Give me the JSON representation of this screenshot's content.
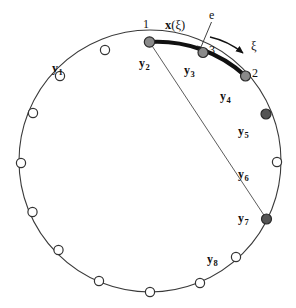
{
  "figure": {
    "name": "circle-element-diagram",
    "geometry": {
      "center_x": 150,
      "center_y": 161,
      "radius": 131,
      "width": 296,
      "height": 308
    },
    "colors": {
      "curve": "#3a3a3a",
      "element_arc": "#111111",
      "node_open_fill": "#ffffff",
      "node_open_stroke": "#333333",
      "node_gray_fill": "#8a8a8a",
      "node_dark_fill": "#555555",
      "node_stroke": "#2b2b2b",
      "chord": "#4a4a4a",
      "text": "#111111"
    }
  },
  "control_point_labels": [
    {
      "id": "y1",
      "base": "y",
      "sub": "1",
      "x": 52,
      "y": 62
    },
    {
      "id": "y2",
      "base": "y",
      "sub": "2",
      "x": 139,
      "y": 57
    },
    {
      "id": "y3",
      "base": "y",
      "sub": "3",
      "x": 184,
      "y": 64
    },
    {
      "id": "y4",
      "base": "y",
      "sub": "4",
      "x": 220,
      "y": 90
    },
    {
      "id": "y5",
      "base": "y",
      "sub": "5",
      "x": 238,
      "y": 125
    },
    {
      "id": "y6",
      "base": "y",
      "sub": "6",
      "x": 238,
      "y": 168
    },
    {
      "id": "y7",
      "base": "y",
      "sub": "7",
      "x": 238,
      "y": 212
    },
    {
      "id": "y8",
      "base": "y",
      "sub": "8",
      "x": 207,
      "y": 253
    }
  ],
  "element_nodes": [
    {
      "id": "node-1",
      "number": "1",
      "cx": 149.5,
      "cy": 42.0,
      "fill": "gray",
      "r": 5.2,
      "label_x": 143,
      "label_y": 18
    },
    {
      "id": "node-3",
      "number": "3",
      "cx": 203.0,
      "cy": 52.5,
      "fill": "gray",
      "r": 5.0,
      "label_x": 209,
      "label_y": 44
    },
    {
      "id": "node-2",
      "number": "2",
      "cx": 245.5,
      "cy": 76.0,
      "fill": "gray",
      "r": 5.0,
      "label_x": 252,
      "label_y": 67
    }
  ],
  "circle_nodes": [
    {
      "id": "cn-1",
      "cx": 266.0,
      "cy": 114.0,
      "fill": "dark",
      "r": 5.0
    },
    {
      "id": "cn-2",
      "cx": 277.0,
      "cy": 162.0,
      "fill": "open",
      "r": 4.6
    },
    {
      "id": "cn-3",
      "cx": 266.5,
      "cy": 219.0,
      "fill": "dark",
      "r": 5.0
    },
    {
      "id": "cn-4",
      "cx": 236.0,
      "cy": 257.0,
      "fill": "open",
      "r": 4.6
    },
    {
      "id": "cn-5",
      "cx": 200.0,
      "cy": 283.0,
      "fill": "open",
      "r": 4.6
    },
    {
      "id": "cn-6",
      "cx": 150.0,
      "cy": 292.0,
      "fill": "open",
      "r": 4.6
    },
    {
      "id": "cn-7",
      "cx": 99.0,
      "cy": 281.0,
      "fill": "open",
      "r": 4.6
    },
    {
      "id": "cn-8",
      "cx": 58.5,
      "cy": 250.0,
      "fill": "open",
      "r": 4.6
    },
    {
      "id": "cn-9",
      "cx": 32.5,
      "cy": 212.0,
      "fill": "open",
      "r": 4.6
    },
    {
      "id": "cn-10",
      "cx": 21.0,
      "cy": 163.0,
      "fill": "open",
      "r": 4.6
    },
    {
      "id": "cn-11",
      "cx": 33.0,
      "cy": 113.0,
      "fill": "open",
      "r": 4.6
    },
    {
      "id": "cn-12",
      "cx": 60.0,
      "cy": 76.0,
      "fill": "open",
      "r": 4.6
    },
    {
      "id": "cn-13",
      "cx": 105.0,
      "cy": 50.0,
      "fill": "open",
      "r": 4.6
    }
  ],
  "annotations": {
    "element_label": {
      "text": "e",
      "x": 209,
      "y": 9
    },
    "param_arrow_label": {
      "text": "ξ",
      "x": 251,
      "y": 40
    },
    "mapping_label": {
      "bold": "x",
      "paren_open": "(",
      "greek": "ξ",
      "paren_close": ")",
      "x": 165,
      "y": 19
    }
  },
  "chord": {
    "x1": 149.5,
    "y1": 42.0,
    "x2": 266.5,
    "y2": 219.0
  },
  "leader_line": {
    "x1": 211.5,
    "y1": 22.0,
    "x2": 201.0,
    "y2": 47.0,
    "tick_x": 197.0,
    "tick_y": 46.0
  },
  "curved_arrow": {
    "start_x": 210.0,
    "start_y": 37.0,
    "ctrl_x": 228.0,
    "ctrl_y": 41.0,
    "end_x": 243.0,
    "end_y": 53.0
  }
}
